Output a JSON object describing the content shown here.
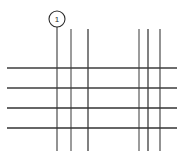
{
  "drawing": {
    "title": "Grid line technical drawing",
    "canvas": {
      "width": 185,
      "height": 158,
      "background": "#ffffff"
    },
    "line_color": "#3c3c3c",
    "line_color_light": "#6e6e6e",
    "callout_color": "#2b2b2b",
    "vertical_lines": [
      {
        "name": "vertical-line-1",
        "x": 57,
        "y1": 27,
        "y2": 151,
        "width": 1.2,
        "color": "#4a4a4a"
      },
      {
        "name": "vertical-line-2",
        "x": 71,
        "y1": 29,
        "y2": 151,
        "width": 1.2,
        "color": "#5a5a5a"
      },
      {
        "name": "vertical-line-3",
        "x": 88,
        "y1": 29,
        "y2": 151,
        "width": 1.3,
        "color": "#3c3c3c"
      },
      {
        "name": "vertical-line-4",
        "x": 139,
        "y1": 29,
        "y2": 151,
        "width": 1.2,
        "color": "#5a5a5a"
      },
      {
        "name": "vertical-line-5",
        "x": 148,
        "y1": 29,
        "y2": 151,
        "width": 1.3,
        "color": "#3c3c3c"
      },
      {
        "name": "vertical-line-6",
        "x": 160,
        "y1": 29,
        "y2": 151,
        "width": 1.2,
        "color": "#4a4a4a"
      }
    ],
    "horizontal_lines": [
      {
        "name": "horizontal-line-1",
        "y": 68,
        "x1": 7,
        "x2": 177,
        "width": 1.3,
        "color": "#3c3c3c"
      },
      {
        "name": "horizontal-line-2",
        "y": 88,
        "x1": 7,
        "x2": 177,
        "width": 1.3,
        "color": "#3c3c3c"
      },
      {
        "name": "horizontal-line-3",
        "y": 108,
        "x1": 7,
        "x2": 177,
        "width": 1.4,
        "color": "#333333"
      },
      {
        "name": "horizontal-line-4",
        "y": 128,
        "x1": 7,
        "x2": 177,
        "width": 1.4,
        "color": "#333333"
      }
    ],
    "callout": {
      "name": "callout-1",
      "label": "1",
      "circle_cx": 57,
      "circle_cy": 19,
      "circle_r": 8,
      "leader_x": 57,
      "leader_y1": 27,
      "leader_y2": 151
    }
  }
}
